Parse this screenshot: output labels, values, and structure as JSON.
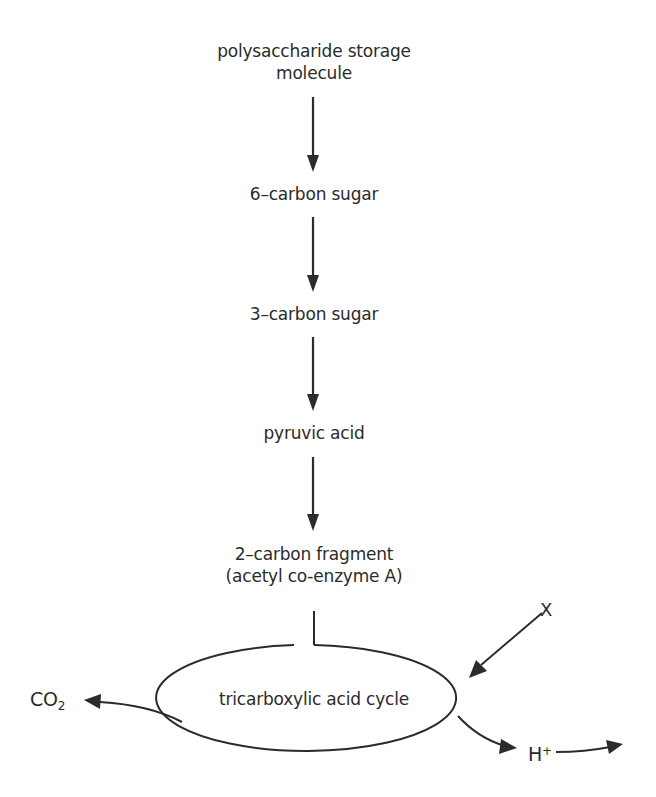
{
  "diagram": {
    "type": "metabolic-pathway-flowchart",
    "nodes": [
      {
        "id": "polysaccharide",
        "lines": [
          "polysaccharide storage",
          "molecule"
        ]
      },
      {
        "id": "six-carbon",
        "lines": [
          "6–carbon sugar"
        ]
      },
      {
        "id": "three-carbon",
        "lines": [
          "3–carbon sugar"
        ]
      },
      {
        "id": "pyruvic",
        "lines": [
          "pyruvic acid"
        ]
      },
      {
        "id": "two-carbon",
        "lines": [
          "2–carbon fragment",
          "(acetyl co-enzyme A)"
        ]
      },
      {
        "id": "tca",
        "lines": [
          "tricarboxylic acid cycle"
        ]
      }
    ],
    "edges": [
      {
        "from": "polysaccharide",
        "to": "six-carbon"
      },
      {
        "from": "six-carbon",
        "to": "three-carbon"
      },
      {
        "from": "three-carbon",
        "to": "pyruvic"
      },
      {
        "from": "pyruvic",
        "to": "two-carbon"
      },
      {
        "from": "two-carbon",
        "to": "tca",
        "style": "joins-cycle"
      },
      {
        "from": "X",
        "to": "tca"
      },
      {
        "from": "tca",
        "to": "CO2"
      },
      {
        "from": "tca",
        "to": "H+"
      },
      {
        "from": "H+",
        "to": "off-page-right"
      }
    ],
    "labels": {
      "polysaccharide_line1": "polysaccharide storage",
      "polysaccharide_line2": "molecule",
      "six_carbon": "6–carbon sugar",
      "three_carbon": "3–carbon sugar",
      "pyruvic": "pyruvic acid",
      "two_carbon_line1": "2–carbon fragment",
      "two_carbon_line2": "(acetyl co-enzyme A)",
      "cycle": "tricarboxylic acid cycle",
      "x_input": "X",
      "co2_base": "CO",
      "co2_sub": "2",
      "h_base": "H",
      "h_sup": "+"
    },
    "colors": {
      "stroke": "#2b2b2b",
      "background": "#ffffff"
    }
  }
}
